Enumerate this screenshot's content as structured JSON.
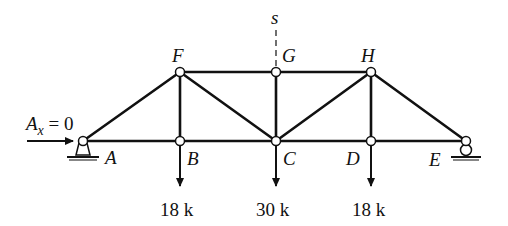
{
  "diagram": {
    "type": "truss",
    "nodes": [
      {
        "id": "A",
        "label": "A",
        "x": 83,
        "y": 141
      },
      {
        "id": "B",
        "label": "B",
        "x": 180,
        "y": 141
      },
      {
        "id": "C",
        "label": "C",
        "x": 276,
        "y": 141
      },
      {
        "id": "D",
        "label": "D",
        "x": 371,
        "y": 141
      },
      {
        "id": "E",
        "label": "E",
        "x": 466,
        "y": 141
      },
      {
        "id": "F",
        "label": "F",
        "x": 180,
        "y": 72
      },
      {
        "id": "G",
        "label": "G",
        "x": 276,
        "y": 72
      },
      {
        "id": "H",
        "label": "H",
        "x": 371,
        "y": 72
      }
    ],
    "members": [
      "A-B",
      "B-C",
      "C-D",
      "D-E",
      "F-G",
      "G-H",
      "A-F",
      "F-B",
      "F-C",
      "G-C",
      "C-H",
      "H-D",
      "H-E"
    ],
    "section_cut": {
      "label": "s",
      "through": "G"
    },
    "reaction": {
      "label_main": "A",
      "label_sub": "x",
      "label_rest": " = 0"
    },
    "supports": {
      "A": "pin",
      "E": "roller"
    },
    "loads": [
      {
        "node": "B",
        "label": "18 k"
      },
      {
        "node": "C",
        "label": "30 k"
      },
      {
        "node": "D",
        "label": "18 k"
      }
    ]
  }
}
